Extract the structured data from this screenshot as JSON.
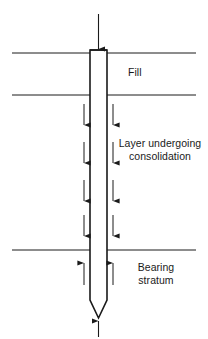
{
  "diagram": {
    "type": "geotechnical-cross-section",
    "line_color": "#1a1a1a",
    "background_color": "#ffffff",
    "strata": [
      {
        "id": "fill",
        "label": "Fill",
        "top_boundary_y": 53,
        "bottom_boundary_y": 95,
        "friction_arrow_direction": "none"
      },
      {
        "id": "consolidation",
        "label": "Layer undergoing\nconsolidation",
        "top_boundary_y": 95,
        "bottom_boundary_y": 250,
        "friction_arrow_direction": "down",
        "friction_arrow_count": 4
      },
      {
        "id": "bearing",
        "label": "Bearing\nstratum",
        "top_boundary_y": 250,
        "bottom_boundary_y": 339,
        "friction_arrow_direction": "up",
        "friction_arrow_count": 1
      }
    ],
    "ground_lines": [
      {
        "name": "ground-line-top",
        "y": 53,
        "x1": 12,
        "x2": 196
      },
      {
        "name": "ground-line-middle",
        "y": 95,
        "x1": 12,
        "x2": 196
      },
      {
        "name": "ground-line-bottom",
        "y": 250,
        "x1": 12,
        "x2": 196
      }
    ],
    "pile": {
      "name": "pile",
      "left_x": 90,
      "right_x": 107,
      "top_y": 50,
      "shaft_bottom_y": 300,
      "tip_y": 318,
      "tip_shape": "V-point"
    },
    "load_arrow_top": {
      "name": "applied-load-arrow",
      "direction": "down",
      "x": 98.5,
      "from_y": 14,
      "to_y": 50
    },
    "reaction_arrow_bottom": {
      "name": "tip-reaction-arrow",
      "direction": "up",
      "x": 98.5,
      "from_y": 336,
      "to_y": 320
    },
    "shaft_friction_arrows": {
      "name": "shaft-friction-arrows",
      "left_x": 84,
      "right_x": 113,
      "down_rows_y": [
        104,
        140,
        180,
        215
      ],
      "up_rows_y": [
        262
      ],
      "length": 22
    }
  }
}
